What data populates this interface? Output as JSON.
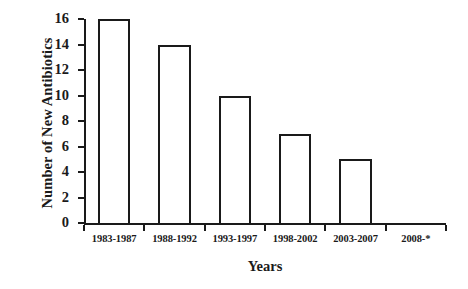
{
  "chart_data": {
    "type": "bar",
    "title": "",
    "xlabel": "Years",
    "ylabel": "Number of New Antibiotics",
    "categories": [
      "1983-1987",
      "1988-1992",
      "1993-1997",
      "1998-2002",
      "2003-2007",
      "2008-*"
    ],
    "values": [
      16,
      14,
      10,
      7,
      5,
      0
    ],
    "ylim": [
      0,
      16
    ],
    "yticks": [
      0,
      2,
      4,
      6,
      8,
      10,
      12,
      14,
      16
    ],
    "ytick_labels": [
      "0",
      "2",
      "4",
      "6",
      "8",
      "10",
      "12",
      "14",
      "16"
    ],
    "grid": false,
    "legend": false,
    "bar_fill_color": "#ffffff",
    "bar_edge_color": "#1a1a1a",
    "axis_color": "#1a1a1a",
    "background_color": "#ffffff"
  }
}
